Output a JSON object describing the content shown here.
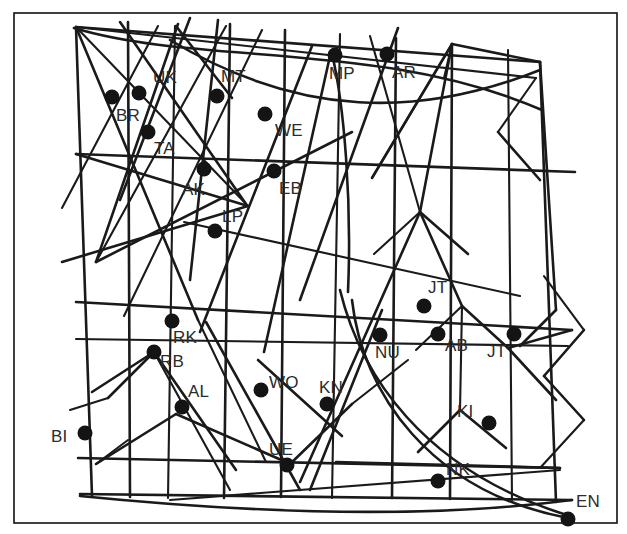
{
  "figure": {
    "title": "",
    "background_color": "#ffffff",
    "ink_color": "#1a1a1a",
    "label_color": "#2b2b2b",
    "marker_color": "#141414",
    "border": {
      "x": 14,
      "y": 13,
      "width": 603,
      "height": 510
    },
    "canvas": {
      "width": 627,
      "height": 534
    }
  },
  "chart_data": {
    "type": "scatter",
    "title": "",
    "xlabel": "",
    "ylabel": "",
    "xlim": [
      0,
      627
    ],
    "ylim": [
      534,
      0
    ],
    "grid": true,
    "legend": null,
    "note": "Hand-drawn distorted-mesh network diagram with labelled station nodes; coordinates are pixel positions of the filled dot markers.",
    "point_labels": [
      "BR",
      "UK",
      "TA",
      "MT",
      "WE",
      "MP",
      "AR",
      "AK",
      "EB",
      "LP",
      "JT",
      "NU",
      "AB",
      "JT",
      "RK",
      "RB",
      "AL",
      "WO",
      "KN",
      "KI",
      "BI",
      "UE",
      "NK",
      "EN"
    ],
    "points": [
      {
        "label": "BR",
        "x": 112,
        "y": 97,
        "label_dx": 4,
        "label_dy": 10
      },
      {
        "label": "UK",
        "x": 139,
        "y": 93,
        "label_dx": 14,
        "label_dy": -24
      },
      {
        "label": "TA",
        "x": 148,
        "y": 132,
        "label_dx": 6,
        "label_dy": 8
      },
      {
        "label": "MT",
        "x": 217,
        "y": 96,
        "label_dx": 4,
        "label_dy": -28
      },
      {
        "label": "WE",
        "x": 265,
        "y": 114,
        "label_dx": 10,
        "label_dy": 8
      },
      {
        "label": "MP",
        "x": 335,
        "y": 55,
        "label_dx": -6,
        "label_dy": 10
      },
      {
        "label": "AR",
        "x": 387,
        "y": 54,
        "label_dx": 5,
        "label_dy": 10
      },
      {
        "label": "AK",
        "x": 204,
        "y": 169,
        "label_dx": -22,
        "label_dy": 12
      },
      {
        "label": "EB",
        "x": 274,
        "y": 171,
        "label_dx": 5,
        "label_dy": 9
      },
      {
        "label": "LP",
        "x": 215,
        "y": 231,
        "label_dx": 7,
        "label_dy": -23
      },
      {
        "label": "JT",
        "x": 424,
        "y": 306,
        "label_dx": 4,
        "label_dy": -27
      },
      {
        "label": "NU",
        "x": 380,
        "y": 335,
        "label_dx": -5,
        "label_dy": 9
      },
      {
        "label": "AB",
        "x": 438,
        "y": 334,
        "label_dx": 7,
        "label_dy": 3
      },
      {
        "label": "JT",
        "x": 514,
        "y": 334,
        "label_dx": -27,
        "label_dy": 9
      },
      {
        "label": "RK",
        "x": 172,
        "y": 321,
        "label_dx": 1,
        "label_dy": 8
      },
      {
        "label": "RB",
        "x": 154,
        "y": 352,
        "label_dx": 6,
        "label_dy": 1
      },
      {
        "label": "AL",
        "x": 182,
        "y": 407,
        "label_dx": 6,
        "label_dy": -24
      },
      {
        "label": "WO",
        "x": 261,
        "y": 390,
        "label_dx": 8,
        "label_dy": -16
      },
      {
        "label": "KN",
        "x": 327,
        "y": 404,
        "label_dx": -8,
        "label_dy": -25
      },
      {
        "label": "KI",
        "x": 489,
        "y": 423,
        "label_dx": -32,
        "label_dy": -20
      },
      {
        "label": "BI",
        "x": 85,
        "y": 433,
        "label_dx": -34,
        "label_dy": -5
      },
      {
        "label": "UE",
        "x": 287,
        "y": 465,
        "label_dx": -18,
        "label_dy": -24
      },
      {
        "label": "NK",
        "x": 438,
        "y": 481,
        "label_dx": 8,
        "label_dy": -20
      },
      {
        "label": "EN",
        "x": 568,
        "y": 519,
        "label_dx": 8,
        "label_dy": -26
      }
    ],
    "marker_radius": 7.5
  },
  "mesh": {
    "description": "Irregular quasi-grid of long straight segments plus three long smooth arcs.",
    "straight_segments": [
      [
        76,
        27,
        92,
        496
      ],
      [
        128,
        22,
        130,
        497
      ],
      [
        175,
        26,
        168,
        498
      ],
      [
        230,
        24,
        224,
        498
      ],
      [
        285,
        30,
        281,
        497
      ],
      [
        340,
        34,
        332,
        498
      ],
      [
        396,
        38,
        392,
        498
      ],
      [
        452,
        44,
        450,
        499
      ],
      [
        508,
        50,
        512,
        500
      ],
      [
        540,
        62,
        556,
        502
      ],
      [
        76,
        27,
        540,
        62
      ],
      [
        76,
        27,
        536,
        78
      ],
      [
        76,
        154,
        575,
        172
      ],
      [
        76,
        302,
        572,
        330
      ],
      [
        76,
        339,
        568,
        346
      ],
      [
        78,
        458,
        560,
        468
      ],
      [
        80,
        494,
        572,
        500
      ],
      [
        76,
        27,
        248,
        206
      ],
      [
        76,
        27,
        198,
        320
      ],
      [
        120,
        22,
        246,
        204
      ],
      [
        158,
        26,
        62,
        208
      ],
      [
        178,
        24,
        96,
        262
      ],
      [
        96,
        262,
        352,
        132
      ],
      [
        96,
        262,
        226,
        26
      ],
      [
        190,
        18,
        120,
        200
      ],
      [
        218,
        20,
        190,
        280
      ],
      [
        262,
        30,
        124,
        316
      ],
      [
        248,
        206,
        62,
        262
      ],
      [
        248,
        206,
        76,
        154
      ],
      [
        184,
        222,
        520,
        296
      ],
      [
        312,
        46,
        200,
        332
      ],
      [
        330,
        56,
        264,
        352
      ],
      [
        370,
        36,
        420,
        212
      ],
      [
        420,
        212,
        300,
        482
      ],
      [
        398,
        28,
        300,
        300
      ],
      [
        444,
        78,
        452,
        44
      ],
      [
        452,
        44,
        420,
        212
      ],
      [
        452,
        44,
        372,
        178
      ],
      [
        372,
        178,
        452,
        44
      ],
      [
        452,
        44,
        540,
        62
      ],
      [
        420,
        212,
        468,
        254
      ],
      [
        420,
        212,
        374,
        254
      ],
      [
        462,
        306,
        420,
        212
      ],
      [
        462,
        306,
        508,
        348
      ],
      [
        462,
        306,
        416,
        350
      ],
      [
        460,
        410,
        418,
        452
      ],
      [
        460,
        410,
        506,
        448
      ],
      [
        460,
        410,
        462,
        306
      ],
      [
        540,
        62,
        556,
        310
      ],
      [
        508,
        348,
        556,
        400
      ],
      [
        536,
        78,
        498,
        132
      ],
      [
        498,
        132,
        540,
        180
      ],
      [
        336,
        462,
        560,
        468
      ],
      [
        170,
        500,
        560,
        470
      ],
      [
        96,
        464,
        176,
        414
      ],
      [
        176,
        414,
        286,
        462
      ],
      [
        96,
        464,
        128,
        440
      ],
      [
        154,
        352,
        108,
        398
      ],
      [
        154,
        352,
        236,
        470
      ],
      [
        154,
        352,
        230,
        490
      ],
      [
        92,
        392,
        154,
        352
      ],
      [
        206,
        322,
        300,
        490
      ],
      [
        108,
        398,
        70,
        410
      ],
      [
        258,
        360,
        342,
        436
      ],
      [
        288,
        466,
        352,
        404
      ],
      [
        352,
        404,
        408,
        360
      ],
      [
        310,
        490,
        382,
        310
      ],
      [
        572,
        330,
        508,
        348
      ],
      [
        544,
        276,
        584,
        330
      ],
      [
        584,
        330,
        544,
        376
      ],
      [
        544,
        376,
        584,
        420
      ],
      [
        584,
        420,
        540,
        468
      ],
      [
        556,
        310,
        520,
        346
      ],
      [
        232,
        98,
        176,
        26
      ],
      [
        198,
        320,
        266,
        462
      ]
    ],
    "arcs": [
      {
        "d": "M 74,28 C 200,66 380,40 542,110"
      },
      {
        "d": "M 170,40 C 300,118 420,118 540,70"
      },
      {
        "d": "M 340,290 C 360,372 420,470 570,516"
      },
      {
        "d": "M 348,292 C 352,200 344,104 332,54"
      },
      {
        "d": "M 80,496 C 240,512 420,520 572,500"
      },
      {
        "d": "M 352,300 C 362,392 430,492 568,518"
      }
    ]
  }
}
